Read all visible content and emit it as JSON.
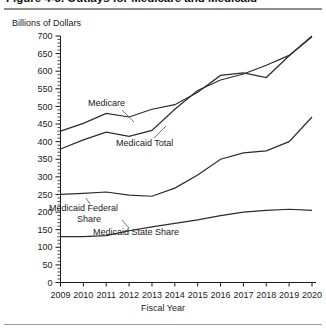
{
  "figure": {
    "title": "Figure 4-3. Outlays for Medicare and Medicaid",
    "y_axis_caption": "Billions of Dollars",
    "x_axis_title": "Fiscal Year"
  },
  "labels": {
    "medicare": "Medicare",
    "medicaid_total": "Medicaid Total",
    "medicaid_federal_1": "Medicaid Federal",
    "medicaid_federal_2": "Share",
    "medicaid_state": "Medicaid State Share"
  },
  "chart_data": {
    "type": "line",
    "title": "Figure 4-3. Outlays for Medicare and Medicaid",
    "xlabel": "Fiscal Year",
    "ylabel": "Billions of Dollars",
    "xlim": [
      2009,
      2020
    ],
    "ylim": [
      0,
      700
    ],
    "ytick_step": 50,
    "yticks": [
      0,
      50,
      100,
      150,
      200,
      250,
      300,
      350,
      400,
      450,
      500,
      550,
      600,
      650,
      700
    ],
    "ytick_labels": [
      "0",
      "50",
      "100",
      "150",
      "200",
      "250",
      "300",
      "350",
      "400",
      "450",
      "500",
      "550",
      "600",
      "650",
      "700"
    ],
    "minor_ticks": true,
    "grid": false,
    "legend": "inline-annotations",
    "categories": [
      2009,
      2010,
      2011,
      2012,
      2013,
      2014,
      2015,
      2016,
      2017,
      2018,
      2019,
      2020
    ],
    "xtick_labels": [
      "2009",
      "2010",
      "2011",
      "2012",
      "2013",
      "2014",
      "2015",
      "2016",
      "2017",
      "2018",
      "2019",
      "2020"
    ],
    "series": [
      {
        "name": "Medicare",
        "values": [
          430,
          452,
          480,
          470,
          492,
          505,
          540,
          588,
          595,
          582,
          644,
          700
        ]
      },
      {
        "name": "Medicaid Total",
        "values": [
          379,
          405,
          427,
          415,
          432,
          492,
          545,
          575,
          592,
          617,
          645,
          698
        ]
      },
      {
        "name": "Medicaid Federal Share",
        "values": [
          250,
          253,
          257,
          248,
          245,
          268,
          305,
          350,
          368,
          374,
          400,
          470
        ]
      },
      {
        "name": "Medicaid State Share",
        "values": [
          130,
          130,
          133,
          147,
          158,
          168,
          178,
          190,
          200,
          205,
          208,
          205
        ]
      }
    ]
  }
}
